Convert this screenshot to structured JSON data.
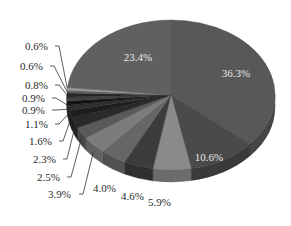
{
  "chart_data": {
    "type": "pie",
    "style": "3d-grayscale",
    "title": "",
    "legend": "none",
    "start_angle_deg": 0,
    "direction": "clockwise",
    "slices": [
      {
        "label": "36.3%",
        "value": 36.3,
        "color": "#585858",
        "label_pos": "inside"
      },
      {
        "label": "10.6%",
        "value": 10.6,
        "color": "#4a4a4a",
        "label_pos": "inside"
      },
      {
        "label": "5.9%",
        "value": 5.9,
        "color": "#8a8a8a",
        "label_pos": "outside"
      },
      {
        "label": "4.6%",
        "value": 4.6,
        "color": "#3c3c3c",
        "label_pos": "outside"
      },
      {
        "label": "4.0%",
        "value": 4.0,
        "color": "#666666",
        "label_pos": "outside"
      },
      {
        "label": "3.9%",
        "value": 3.9,
        "color": "#7c7c7c",
        "label_pos": "outside"
      },
      {
        "label": "2.5%",
        "value": 2.5,
        "color": "#5a5a5a",
        "label_pos": "outside"
      },
      {
        "label": "2.3%",
        "value": 2.3,
        "color": "#2a2a2a",
        "label_pos": "outside"
      },
      {
        "label": "1.6%",
        "value": 1.6,
        "color": "#1e1e1e",
        "label_pos": "outside"
      },
      {
        "label": "1.1%",
        "value": 1.1,
        "color": "#303030",
        "label_pos": "outside"
      },
      {
        "label": "0.9%",
        "value": 0.9,
        "color": "#141414",
        "label_pos": "outside"
      },
      {
        "label": "0.9%",
        "value": 0.9,
        "color": "#404040",
        "label_pos": "outside"
      },
      {
        "label": "0.8%",
        "value": 0.8,
        "color": "#262626",
        "label_pos": "outside"
      },
      {
        "label": "0.6%",
        "value": 0.6,
        "color": "#5e5e5e",
        "label_pos": "outside"
      },
      {
        "label": "0.6%",
        "value": 0.6,
        "color": "#9a9a9a",
        "label_pos": "outside"
      },
      {
        "label": "23.4%",
        "value": 23.4,
        "color": "#606060",
        "label_pos": "inside"
      }
    ],
    "values": [
      36.3,
      10.6,
      5.9,
      4.6,
      4.0,
      3.9,
      2.5,
      2.3,
      1.6,
      1.1,
      0.9,
      0.9,
      0.8,
      0.6,
      0.6,
      23.4
    ],
    "categories": [
      "36.3%",
      "10.6%",
      "5.9%",
      "4.6%",
      "4.0%",
      "3.9%",
      "2.5%",
      "2.3%",
      "1.6%",
      "1.1%",
      "0.9%",
      "0.9%",
      "0.8%",
      "0.6%",
      "0.6%",
      "23.4%"
    ]
  },
  "layout": {
    "cx": 171,
    "cy": 95,
    "rx": 104,
    "ry": 75,
    "depth": 12,
    "outside_labels": [
      {
        "idx": 2,
        "x": 148,
        "y": 206,
        "anchor": "start"
      },
      {
        "idx": 3,
        "x": 121,
        "y": 200,
        "anchor": "start"
      },
      {
        "idx": 4,
        "x": 93,
        "y": 192,
        "anchor": "start"
      },
      {
        "idx": 5,
        "x": 48,
        "y": 198,
        "anchor": "start",
        "lx": 79
      },
      {
        "idx": 6,
        "x": 37,
        "y": 181,
        "anchor": "start",
        "lx": 67
      },
      {
        "idx": 7,
        "x": 33,
        "y": 163,
        "anchor": "start",
        "lx": 63
      },
      {
        "idx": 8,
        "x": 29,
        "y": 145,
        "anchor": "start",
        "lx": 59
      },
      {
        "idx": 9,
        "x": 25,
        "y": 128,
        "anchor": "start",
        "lx": 55
      },
      {
        "idx": 10,
        "x": 22,
        "y": 114,
        "anchor": "start",
        "lx": 52
      },
      {
        "idx": 11,
        "x": 22,
        "y": 102,
        "anchor": "start",
        "lx": 52
      },
      {
        "idx": 12,
        "x": 25,
        "y": 89,
        "anchor": "start",
        "lx": 55
      },
      {
        "idx": 13,
        "x": 20,
        "y": 70,
        "anchor": "start",
        "lx": 50
      },
      {
        "idx": 14,
        "x": 25,
        "y": 50,
        "anchor": "start",
        "lx": 55
      }
    ],
    "inside_labels": [
      {
        "idx": 0,
        "x": 236,
        "y": 77
      },
      {
        "idx": 1,
        "x": 209,
        "y": 161
      },
      {
        "idx": 15,
        "x": 138,
        "y": 61
      }
    ]
  }
}
